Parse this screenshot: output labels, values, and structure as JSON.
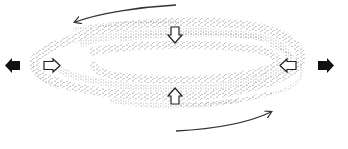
{
  "diagram": {
    "description": "Stippled elliptical band with compression and extension arrows and rotation arrows",
    "colors": {
      "background": "#ffffff",
      "stipple": "#555555",
      "arrow_fill": "#111111",
      "arrow_outline": "#222222",
      "curve": "#333333"
    },
    "arrows": {
      "outward_filled": [
        {
          "id": "left-outward",
          "direction": "left"
        },
        {
          "id": "right-outward",
          "direction": "right"
        }
      ],
      "inward_hollow": [
        {
          "id": "left-inward",
          "direction": "right"
        },
        {
          "id": "top-inward",
          "direction": "down"
        },
        {
          "id": "bottom-inward",
          "direction": "up"
        },
        {
          "id": "right-inward",
          "direction": "left"
        }
      ],
      "rotation": [
        {
          "id": "top-rotation",
          "direction": "right-to-left"
        },
        {
          "id": "bottom-rotation",
          "direction": "left-to-right"
        }
      ]
    }
  }
}
